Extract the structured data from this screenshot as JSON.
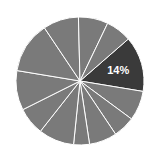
{
  "chart_data": {
    "type": "pie",
    "title": "",
    "center": [
      80,
      81
    ],
    "radius": 64,
    "start_angle_deg": 41,
    "direction": "clockwise",
    "slices": [
      {
        "value": 14,
        "label": "14%",
        "color": "#3a3a3a",
        "highlighted": true
      },
      {
        "value": 7.5,
        "label": "",
        "color": "#7a7a7a"
      },
      {
        "value": 5.5,
        "label": "",
        "color": "#7a7a7a"
      },
      {
        "value": 7,
        "label": "",
        "color": "#7a7a7a"
      },
      {
        "value": 4,
        "label": "",
        "color": "#7a7a7a"
      },
      {
        "value": 9,
        "label": "",
        "color": "#7a7a7a"
      },
      {
        "value": 7,
        "label": "",
        "color": "#7a7a7a"
      },
      {
        "value": 10,
        "label": "",
        "color": "#7a7a7a"
      },
      {
        "value": 13,
        "label": "",
        "color": "#7a7a7a"
      },
      {
        "value": 9,
        "label": "",
        "color": "#7a7a7a"
      },
      {
        "value": 7.5,
        "label": "",
        "color": "#7a7a7a"
      },
      {
        "value": 6.5,
        "label": "",
        "color": "#7a7a7a"
      }
    ],
    "separator_color": "#ffffff",
    "legend": null
  }
}
